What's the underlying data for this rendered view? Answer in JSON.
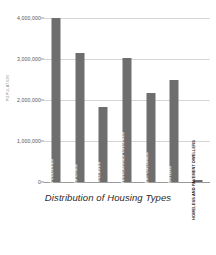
{
  "chart_data": {
    "type": "bar",
    "title": "Distribution of Housing Types",
    "xlabel": "",
    "ylabel": "POPULATION",
    "ylim": [
      0,
      4000000
    ],
    "grid": true,
    "legend": false,
    "orientation": "vertical",
    "bar_color": "#6e6e6e",
    "categories": [
      "PLANNED COLONIES",
      "WALLED CITIES",
      "URBAN VILLAGES",
      "UNAUTHORISED AND REGULARISED COLONIES",
      "RESETTLEMENT COLONIES",
      "JJ CLUSTERS",
      "HOMELESS AND PAVEMENT DWELLERS"
    ],
    "values": [
      4010000,
      3150000,
      1830000,
      3020000,
      2180000,
      2500000,
      55000
    ],
    "yticks": [
      0,
      1000000,
      2000000,
      3000000,
      4000000
    ],
    "ytick_labels": [
      "0",
      "1,000,000",
      "2,000,000",
      "3,000,000",
      "4,000,000"
    ]
  }
}
